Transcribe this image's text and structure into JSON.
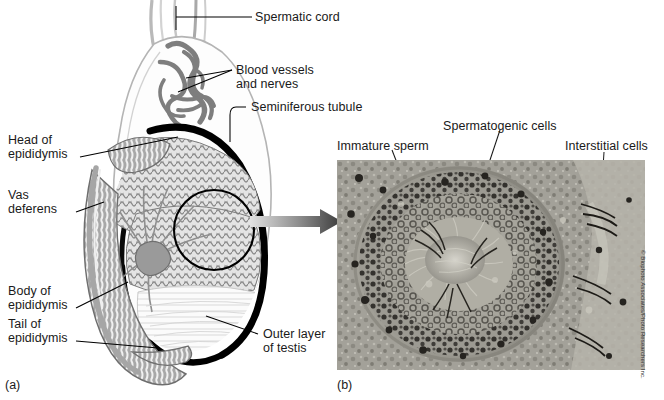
{
  "figure": {
    "panels": [
      {
        "id": "a",
        "letter": "(a)",
        "type": "illustration",
        "description": "Sagittal section of testis and epididymis"
      },
      {
        "id": "b",
        "letter": "(b)",
        "type": "micrograph",
        "description": "Light micrograph of seminiferous tubule cross section"
      }
    ]
  },
  "panel_a": {
    "labels": [
      {
        "name": "spermatic-cord",
        "text": "Spermatic cord"
      },
      {
        "name": "blood-vessels-and-nerves",
        "line1": "Blood vessels",
        "line2": "and nerves"
      },
      {
        "name": "seminiferous-tubule",
        "text": "Seminiferous tubule"
      },
      {
        "name": "head-of-epididymis",
        "line1": "Head of",
        "line2": "epididymis"
      },
      {
        "name": "vas-deferens",
        "line1": "Vas",
        "line2": "deferens"
      },
      {
        "name": "body-of-epididymis",
        "line1": "Body of",
        "line2": "epididymis"
      },
      {
        "name": "tail-of-epididymis",
        "line1": "Tail of",
        "line2": "epididymis"
      },
      {
        "name": "outer-layer-of-testis",
        "line1": "Outer layer",
        "line2": "of testis"
      }
    ]
  },
  "panel_b": {
    "labels": [
      {
        "name": "immature-sperm",
        "text": "Immature sperm"
      },
      {
        "name": "spermatogenic-cells",
        "text": "Spermatogenic cells"
      },
      {
        "name": "interstitial-cells",
        "text": "Interstitial cells"
      }
    ],
    "credit": "© Biophoto Associates/Photo Researchers Inc."
  },
  "colors": {
    "background": "#ffffff",
    "label_text": "#1a1a1a",
    "leader_line": "#000000",
    "tissue_gray": "#9d9d9d",
    "tissue_light": "#c9c9c9",
    "capsule_black": "#000000",
    "arrow_dark": "#4a4a4a",
    "arrow_light": "#d8d8d8",
    "micrograph_base": "#9a9a93"
  }
}
